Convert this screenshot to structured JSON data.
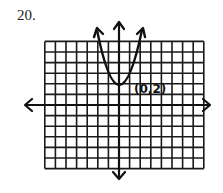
{
  "problem_number": "20.",
  "chart_data": {
    "type": "line",
    "title": "",
    "xlabel": "",
    "ylabel": "",
    "function": "y = x^2 + 2",
    "xlim": [
      -7,
      8
    ],
    "ylim": [
      -6,
      6
    ],
    "grid": true,
    "grid_step": 1,
    "axes_arrows": true,
    "series": [
      {
        "name": "parabola",
        "x": [
          -2.2,
          -1.5,
          -1,
          -0.5,
          0,
          0.5,
          1,
          1.5,
          2.2
        ],
        "y": [
          7.1,
          4.25,
          3,
          2.25,
          2,
          2.25,
          3,
          4.25,
          7.1
        ]
      }
    ],
    "annotations": [
      {
        "text": "(0,2)",
        "x": 0,
        "y": 2
      }
    ]
  },
  "colors": {
    "ink": "#111111",
    "grid": "#1a1a1a",
    "background": "#ffffff"
  }
}
